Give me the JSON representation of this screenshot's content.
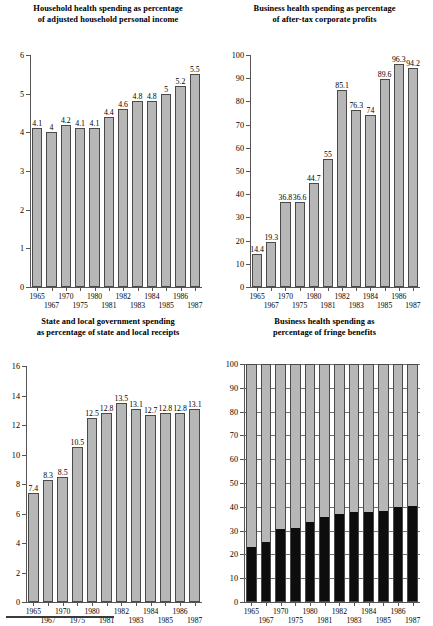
{
  "figure": {
    "panel_count": 4,
    "bar_fill_color": "#b7b7b7",
    "bar_edge_color": "#4a4a4a",
    "stack_lower_color": "#0d0d0d",
    "footnote_rule": true
  },
  "chart_data": [
    {
      "id": "household-health-spending",
      "type": "bar",
      "title_line1": "Household health spending as percentage",
      "title_line2": "of adjusted household personal income",
      "xlabel": "",
      "ylabel": "",
      "ylim": [
        0,
        6
      ],
      "yticks": [
        0,
        1,
        2,
        3,
        4,
        5,
        6
      ],
      "grid": false,
      "categories": [
        "1965",
        "1967",
        "1970",
        "1975",
        "1980",
        "1981",
        "1982",
        "1983",
        "1984",
        "1985",
        "1986",
        "1987"
      ],
      "values": [
        4.1,
        4,
        4.2,
        4.1,
        4.1,
        4.4,
        4.6,
        4.8,
        4.8,
        5,
        5.2,
        5.5
      ],
      "labels": [
        "4.1",
        "4",
        "4.2",
        "4.1",
        "4.1",
        "4.4",
        "4.6",
        "4.8",
        "4.8",
        "5",
        "5.2",
        "5.5"
      ]
    },
    {
      "id": "business-health-spending-profits",
      "type": "bar",
      "title_line1": "Business health spending as percentage",
      "title_line2": "of after-tax corporate profits",
      "xlabel": "",
      "ylabel": "",
      "ylim": [
        0,
        100
      ],
      "yticks": [
        0,
        10,
        20,
        30,
        40,
        50,
        60,
        70,
        80,
        90,
        100
      ],
      "grid": false,
      "categories": [
        "1965",
        "1967",
        "1970",
        "1975",
        "1980",
        "1981",
        "1982",
        "1983",
        "1984",
        "1985",
        "1986",
        "1987"
      ],
      "values": [
        14.4,
        19.3,
        36.8,
        36.6,
        44.7,
        55,
        85.1,
        76.3,
        74,
        89.6,
        96.3,
        94.2
      ],
      "labels": [
        "14.4",
        "19.3",
        "36.8",
        "36.6",
        "44.7",
        "55",
        "85.1",
        "76.3",
        "74",
        "89.6",
        "96.3",
        "94.2"
      ]
    },
    {
      "id": "state-local-government-spending",
      "type": "bar",
      "title_line1": "State and local government spending",
      "title_line2": "as percentage of state and local receipts",
      "xlabel": "",
      "ylabel": "",
      "ylim": [
        0,
        16
      ],
      "yticks": [
        0,
        2,
        4,
        6,
        8,
        10,
        12,
        14,
        16
      ],
      "grid": false,
      "categories": [
        "1965",
        "1967",
        "1970",
        "1975",
        "1980",
        "1981",
        "1982",
        "1983",
        "1984",
        "1985",
        "1986",
        "1987"
      ],
      "values": [
        7.4,
        8.3,
        8.5,
        10.5,
        12.5,
        12.8,
        13.5,
        13.1,
        12.7,
        12.8,
        12.8,
        13.1
      ],
      "labels": [
        "7.4",
        "8.3",
        "8.5",
        "10.5",
        "12.5",
        "12.8",
        "13.5",
        "13.1",
        "12.7",
        "12.8",
        "12.8",
        "13.1"
      ]
    },
    {
      "id": "business-health-spending-fringe",
      "type": "bar",
      "stacked": true,
      "title_line1": "Business health spending as",
      "title_line2": "percentage of fringe benefits",
      "xlabel": "",
      "ylabel": "",
      "ylim": [
        0,
        100
      ],
      "yticks": [
        0,
        10,
        20,
        30,
        40,
        50,
        60,
        70,
        80,
        90,
        100
      ],
      "grid": true,
      "categories": [
        "1965",
        "1967",
        "1970",
        "1975",
        "1980",
        "1981",
        "1982",
        "1983",
        "1984",
        "1985",
        "1986",
        "1987"
      ],
      "series": [
        {
          "name": "health spending share",
          "values": [
            22.7,
            25.1,
            30.4,
            30.9,
            33.4,
            35.6,
            36.8,
            37.8,
            37.7,
            38.3,
            39.7,
            40.4
          ]
        },
        {
          "name": "other fringe benefits",
          "values": [
            77.3,
            74.9,
            69.6,
            69.1,
            66.6,
            64.4,
            63.2,
            62.2,
            62.3,
            61.7,
            60.3,
            59.6
          ]
        }
      ],
      "labels": []
    }
  ]
}
